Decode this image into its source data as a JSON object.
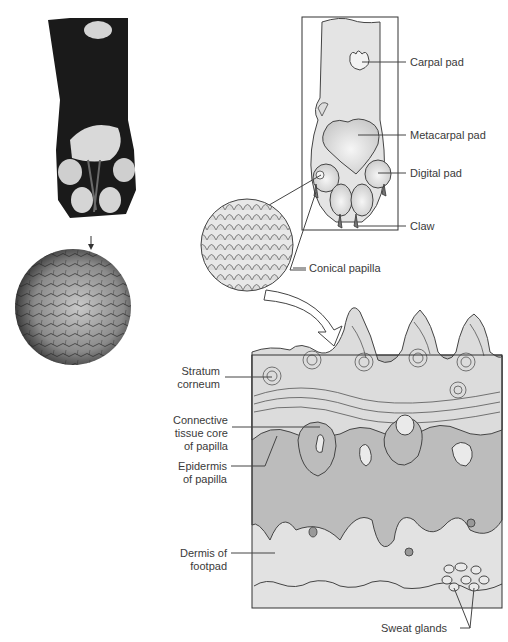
{
  "figure": {
    "panels": {
      "photo_paw": "Photograph of dog paw (plantar view)",
      "photo_closeup": "Close-up photograph of pad surface",
      "paw_diagram": "Schematic of paw with pads",
      "papilla_magnifier": "Magnified conical papillae",
      "cross_section": "Cross-section of footpad"
    }
  },
  "labels": {
    "carpal_pad": "Carpal pad",
    "metacarpal_pad": "Metacarpal pad",
    "digital_pad": "Digital pad",
    "claw": "Claw",
    "conical_papilla": "Conical papilla",
    "stratum_corneum": [
      "Stratum",
      "corneum"
    ],
    "connective_tissue": [
      "Connective",
      "tissue core",
      "of papilla"
    ],
    "epidermis": [
      "Epidermis",
      "of papilla"
    ],
    "dermis": [
      "Dermis of",
      "footpad"
    ],
    "sweat_glands": "Sweat glands"
  },
  "colors": {
    "line": "#444444",
    "pad_fill": "#d6d6d6",
    "skin_fill": "#e4e4e4",
    "epidermis_fill": "#b9b9b9",
    "dermis_fill": "#e2e2e2",
    "photo_dark": "#1a1a1a"
  }
}
